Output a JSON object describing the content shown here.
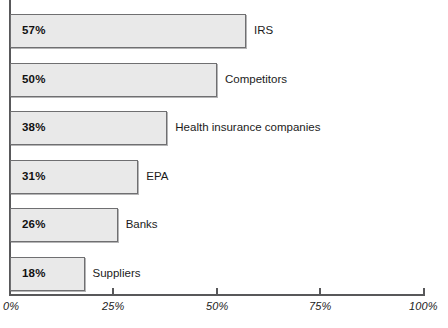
{
  "chart_data": {
    "type": "bar",
    "orientation": "horizontal",
    "title": "",
    "subtitle": "",
    "xlabel": "",
    "ylabel": "",
    "xlim": [
      0,
      100
    ],
    "grid": false,
    "legend": null,
    "categories": [
      "IRS",
      "Competitors",
      "Health insurance companies",
      "EPA",
      "Banks",
      "Suppliers"
    ],
    "values": [
      57,
      50,
      38,
      31,
      26,
      18
    ],
    "value_labels": [
      "57%",
      "50%",
      "38%",
      "31%",
      "26%",
      "18%"
    ],
    "xticks": [
      0,
      25,
      50,
      75,
      100
    ],
    "xtick_labels": [
      "0%",
      "25%",
      "50%",
      "75%",
      "100%"
    ],
    "bar_fill_color": "#e9e9e9",
    "bar_border_color": "#6f6f71",
    "axis_color": "#58585a",
    "text_color": "#1b1b1b"
  },
  "bars": [
    {
      "label": "IRS",
      "value_label": "57%"
    },
    {
      "label": "Competitors",
      "value_label": "50%"
    },
    {
      "label": "Health insurance companies",
      "value_label": "38%"
    },
    {
      "label": "EPA",
      "value_label": "31%"
    },
    {
      "label": "Banks",
      "value_label": "26%"
    },
    {
      "label": "Suppliers",
      "value_label": "18%"
    }
  ],
  "axis": {
    "ticks": [
      {
        "label": "0%"
      },
      {
        "label": "25%"
      },
      {
        "label": "50%"
      },
      {
        "label": "75%"
      },
      {
        "label": "100%"
      }
    ]
  }
}
